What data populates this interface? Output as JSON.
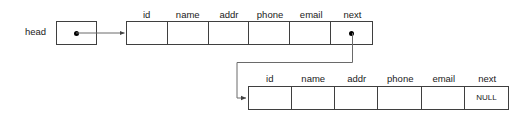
{
  "diagram": {
    "head": {
      "label": "head",
      "pointer_symbol": "●"
    },
    "fields": [
      "id",
      "name",
      "addr",
      "phone",
      "email",
      "next"
    ],
    "nodes": [
      {
        "name": "node-1",
        "headers": [
          "id",
          "name",
          "addr",
          "phone",
          "email",
          "next"
        ],
        "values": [
          "",
          "",
          "",
          "",
          "",
          ""
        ],
        "next_is_pointer": true,
        "next_value": ""
      },
      {
        "name": "node-2",
        "headers": [
          "id",
          "name",
          "addr",
          "phone",
          "email",
          "next"
        ],
        "values": [
          "",
          "",
          "",
          "",
          "",
          "NULL"
        ],
        "next_is_pointer": false,
        "next_value": "NULL"
      }
    ],
    "colors": {
      "background": "#ffffff",
      "stroke": "#3f3f3f",
      "connector": "#5a5a5a",
      "text": "#1a1a1a",
      "dot": "#000000"
    }
  }
}
